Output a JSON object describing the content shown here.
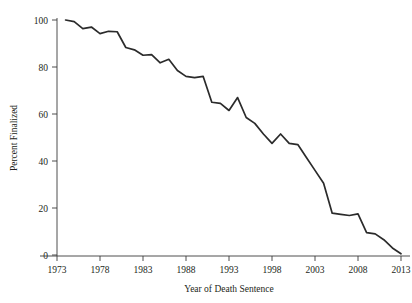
{
  "figure": {
    "background_color": "#ffffff",
    "line_color": "#2b2b2b",
    "axis_color": "#3b3b3b",
    "text_color": "#231f20"
  },
  "axes": {
    "x_title": "Year of Death Sentence",
    "y_title": "Percent Finalized",
    "x_tick_labels": [
      "1973",
      "1978",
      "1983",
      "1988",
      "1993",
      "1998",
      "2003",
      "2008",
      "2013"
    ],
    "y_tick_labels": [
      "0",
      "20",
      "40",
      "60",
      "80",
      "100"
    ]
  },
  "chart_data": {
    "type": "line",
    "title": "",
    "xlabel": "Year of Death Sentence",
    "ylabel": "Percent Finalized",
    "xlim": [
      1973,
      2013
    ],
    "ylim": [
      0,
      100
    ],
    "xticks": [
      1973,
      1978,
      1983,
      1988,
      1993,
      1998,
      2003,
      2008,
      2013
    ],
    "yticks": [
      0,
      20,
      40,
      60,
      80,
      100
    ],
    "grid": false,
    "legend": false,
    "x": [
      1974,
      1975,
      1976,
      1977,
      1978,
      1979,
      1980,
      1981,
      1982,
      1983,
      1984,
      1985,
      1986,
      1987,
      1988,
      1989,
      1990,
      1991,
      1992,
      1993,
      1994,
      1995,
      1996,
      1997,
      1998,
      1999,
      2000,
      2001,
      2002,
      2003,
      2004,
      2005,
      2006,
      2007,
      2008,
      2009,
      2010,
      2011,
      2012,
      2013
    ],
    "series": [
      {
        "name": "Percent Finalized",
        "values": [
          100.0,
          99.3,
          96.3,
          97.0,
          94.2,
          95.2,
          95.0,
          88.3,
          87.3,
          85.0,
          85.3,
          81.8,
          83.3,
          78.5,
          76.0,
          75.5,
          76.0,
          65.0,
          64.5,
          61.5,
          67.0,
          58.5,
          56.0,
          51.5,
          47.5,
          51.5,
          47.5,
          47.0,
          41.5,
          36.0,
          30.5,
          17.8,
          17.3,
          16.8,
          17.5,
          9.5,
          9.0,
          6.5,
          3.0,
          0.5
        ]
      }
    ]
  }
}
